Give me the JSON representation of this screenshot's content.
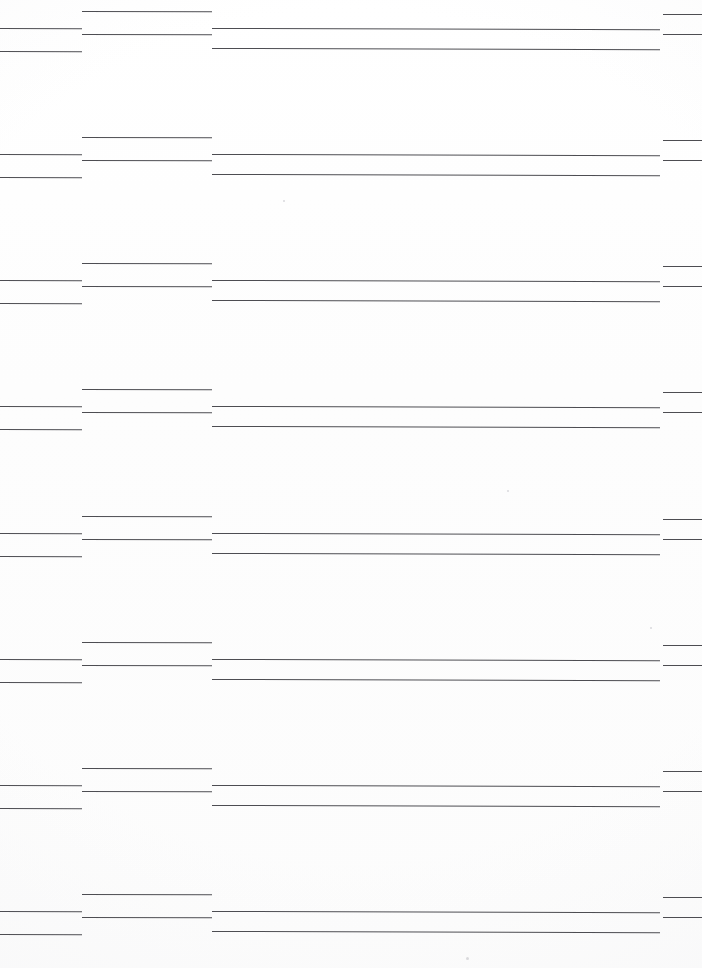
{
  "document": {
    "kind": "scanned-ruled-sheet",
    "page_width": 702,
    "page_height": 968,
    "background_color": "#ffffff",
    "rule_color": "#4d4d52",
    "visible_text": "",
    "note": ""
  },
  "columns": [
    {
      "id": "col-left",
      "x": 0,
      "width": 82
    },
    {
      "id": "col-second",
      "x": 82,
      "width": 130
    },
    {
      "id": "col-main",
      "x": 212,
      "width": 448
    },
    {
      "id": "col-right",
      "x": 663,
      "width": 39
    }
  ],
  "groups": [
    {
      "id": "group-1",
      "top": 0,
      "rules": [
        {
          "col": "col-second",
          "y": 11,
          "x": 82,
          "width": 130,
          "weight": "light",
          "skew": "skew-mid"
        },
        {
          "col": "col-right",
          "y": 14,
          "x": 663,
          "width": 39,
          "weight": "light",
          "skew": "skew-short"
        },
        {
          "col": "col-left",
          "y": 28,
          "x": 0,
          "width": 82,
          "weight": "light",
          "skew": "skew-short"
        },
        {
          "col": "col-main",
          "y": 28,
          "x": 212,
          "width": 448,
          "weight": "light",
          "skew": "skew-long"
        },
        {
          "col": "col-second",
          "y": 34,
          "x": 82,
          "width": 130,
          "weight": "dark",
          "skew": "skew-mid"
        },
        {
          "col": "col-right",
          "y": 34,
          "x": 663,
          "width": 39,
          "weight": "dark",
          "skew": "skew-short"
        },
        {
          "col": "col-left",
          "y": 51,
          "x": 0,
          "width": 82,
          "weight": "dark",
          "skew": "skew-short"
        },
        {
          "col": "col-main",
          "y": 48,
          "x": 212,
          "width": 448,
          "weight": "dark",
          "skew": "skew-long"
        }
      ]
    },
    {
      "id": "group-2",
      "top": 126,
      "rules": [
        {
          "col": "col-second",
          "y": 11,
          "x": 82,
          "width": 130,
          "weight": "light",
          "skew": "skew-mid"
        },
        {
          "col": "col-right",
          "y": 14,
          "x": 663,
          "width": 39,
          "weight": "light",
          "skew": "skew-short"
        },
        {
          "col": "col-left",
          "y": 28,
          "x": 0,
          "width": 82,
          "weight": "light",
          "skew": "skew-short"
        },
        {
          "col": "col-main",
          "y": 28,
          "x": 212,
          "width": 448,
          "weight": "light",
          "skew": "skew-long"
        },
        {
          "col": "col-second",
          "y": 34,
          "x": 82,
          "width": 130,
          "weight": "dark",
          "skew": "skew-mid"
        },
        {
          "col": "col-right",
          "y": 34,
          "x": 663,
          "width": 39,
          "weight": "dark",
          "skew": "skew-short"
        },
        {
          "col": "col-left",
          "y": 51,
          "x": 0,
          "width": 82,
          "weight": "dark",
          "skew": "skew-short"
        },
        {
          "col": "col-main",
          "y": 48,
          "x": 212,
          "width": 448,
          "weight": "dark",
          "skew": "skew-long"
        }
      ]
    },
    {
      "id": "group-3",
      "top": 252,
      "rules": [
        {
          "col": "col-second",
          "y": 11,
          "x": 82,
          "width": 130,
          "weight": "light",
          "skew": "skew-mid"
        },
        {
          "col": "col-right",
          "y": 14,
          "x": 663,
          "width": 39,
          "weight": "light",
          "skew": "skew-short"
        },
        {
          "col": "col-left",
          "y": 28,
          "x": 0,
          "width": 82,
          "weight": "light",
          "skew": "skew-short"
        },
        {
          "col": "col-main",
          "y": 28,
          "x": 212,
          "width": 448,
          "weight": "light",
          "skew": "skew-long"
        },
        {
          "col": "col-second",
          "y": 34,
          "x": 82,
          "width": 130,
          "weight": "dark",
          "skew": "skew-mid"
        },
        {
          "col": "col-right",
          "y": 34,
          "x": 663,
          "width": 39,
          "weight": "dark",
          "skew": "skew-short"
        },
        {
          "col": "col-left",
          "y": 51,
          "x": 0,
          "width": 82,
          "weight": "dark",
          "skew": "skew-short"
        },
        {
          "col": "col-main",
          "y": 48,
          "x": 212,
          "width": 448,
          "weight": "dark",
          "skew": "skew-long"
        }
      ]
    },
    {
      "id": "group-4",
      "top": 378,
      "rules": [
        {
          "col": "col-second",
          "y": 11,
          "x": 82,
          "width": 130,
          "weight": "light",
          "skew": "skew-mid"
        },
        {
          "col": "col-right",
          "y": 14,
          "x": 663,
          "width": 39,
          "weight": "light",
          "skew": "skew-short"
        },
        {
          "col": "col-left",
          "y": 28,
          "x": 0,
          "width": 82,
          "weight": "light",
          "skew": "skew-short"
        },
        {
          "col": "col-main",
          "y": 28,
          "x": 212,
          "width": 448,
          "weight": "light",
          "skew": "skew-long"
        },
        {
          "col": "col-second",
          "y": 34,
          "x": 82,
          "width": 130,
          "weight": "dark",
          "skew": "skew-mid"
        },
        {
          "col": "col-right",
          "y": 34,
          "x": 663,
          "width": 39,
          "weight": "dark",
          "skew": "skew-short"
        },
        {
          "col": "col-left",
          "y": 51,
          "x": 0,
          "width": 82,
          "weight": "dark",
          "skew": "skew-short"
        },
        {
          "col": "col-main",
          "y": 48,
          "x": 212,
          "width": 448,
          "weight": "dark",
          "skew": "skew-long"
        }
      ]
    },
    {
      "id": "group-5",
      "top": 505,
      "rules": [
        {
          "col": "col-second",
          "y": 11,
          "x": 82,
          "width": 130,
          "weight": "light",
          "skew": "skew-mid"
        },
        {
          "col": "col-right",
          "y": 14,
          "x": 663,
          "width": 39,
          "weight": "light",
          "skew": "skew-short"
        },
        {
          "col": "col-left",
          "y": 28,
          "x": 0,
          "width": 82,
          "weight": "light",
          "skew": "skew-short"
        },
        {
          "col": "col-main",
          "y": 28,
          "x": 212,
          "width": 448,
          "weight": "light",
          "skew": "skew-long"
        },
        {
          "col": "col-second",
          "y": 34,
          "x": 82,
          "width": 130,
          "weight": "dark",
          "skew": "skew-mid"
        },
        {
          "col": "col-right",
          "y": 34,
          "x": 663,
          "width": 39,
          "weight": "dark",
          "skew": "skew-short"
        },
        {
          "col": "col-left",
          "y": 51,
          "x": 0,
          "width": 82,
          "weight": "dark",
          "skew": "skew-short"
        },
        {
          "col": "col-main",
          "y": 48,
          "x": 212,
          "width": 448,
          "weight": "dark",
          "skew": "skew-long"
        }
      ]
    },
    {
      "id": "group-6",
      "top": 631,
      "rules": [
        {
          "col": "col-second",
          "y": 11,
          "x": 82,
          "width": 130,
          "weight": "light",
          "skew": "skew-mid"
        },
        {
          "col": "col-right",
          "y": 14,
          "x": 663,
          "width": 39,
          "weight": "light",
          "skew": "skew-short"
        },
        {
          "col": "col-left",
          "y": 28,
          "x": 0,
          "width": 82,
          "weight": "light",
          "skew": "skew-short"
        },
        {
          "col": "col-main",
          "y": 28,
          "x": 212,
          "width": 448,
          "weight": "light",
          "skew": "skew-long"
        },
        {
          "col": "col-second",
          "y": 34,
          "x": 82,
          "width": 130,
          "weight": "dark",
          "skew": "skew-mid"
        },
        {
          "col": "col-right",
          "y": 34,
          "x": 663,
          "width": 39,
          "weight": "dark",
          "skew": "skew-short"
        },
        {
          "col": "col-left",
          "y": 51,
          "x": 0,
          "width": 82,
          "weight": "dark",
          "skew": "skew-short"
        },
        {
          "col": "col-main",
          "y": 48,
          "x": 212,
          "width": 448,
          "weight": "dark",
          "skew": "skew-long"
        }
      ]
    },
    {
      "id": "group-7",
      "top": 757,
      "rules": [
        {
          "col": "col-second",
          "y": 11,
          "x": 82,
          "width": 130,
          "weight": "light",
          "skew": "skew-mid"
        },
        {
          "col": "col-right",
          "y": 14,
          "x": 663,
          "width": 39,
          "weight": "light",
          "skew": "skew-short"
        },
        {
          "col": "col-left",
          "y": 28,
          "x": 0,
          "width": 82,
          "weight": "light",
          "skew": "skew-short"
        },
        {
          "col": "col-main",
          "y": 28,
          "x": 212,
          "width": 448,
          "weight": "light",
          "skew": "skew-long"
        },
        {
          "col": "col-second",
          "y": 34,
          "x": 82,
          "width": 130,
          "weight": "dark",
          "skew": "skew-mid"
        },
        {
          "col": "col-right",
          "y": 34,
          "x": 663,
          "width": 39,
          "weight": "dark",
          "skew": "skew-short"
        },
        {
          "col": "col-left",
          "y": 51,
          "x": 0,
          "width": 82,
          "weight": "dark",
          "skew": "skew-short"
        },
        {
          "col": "col-main",
          "y": 48,
          "x": 212,
          "width": 448,
          "weight": "dark",
          "skew": "skew-long"
        }
      ]
    },
    {
      "id": "group-8",
      "top": 883,
      "rules": [
        {
          "col": "col-second",
          "y": 11,
          "x": 82,
          "width": 130,
          "weight": "light",
          "skew": "skew-mid"
        },
        {
          "col": "col-right",
          "y": 14,
          "x": 663,
          "width": 39,
          "weight": "light",
          "skew": "skew-short"
        },
        {
          "col": "col-left",
          "y": 28,
          "x": 0,
          "width": 82,
          "weight": "light",
          "skew": "skew-short"
        },
        {
          "col": "col-main",
          "y": 28,
          "x": 212,
          "width": 448,
          "weight": "light",
          "skew": "skew-long"
        },
        {
          "col": "col-second",
          "y": 34,
          "x": 82,
          "width": 130,
          "weight": "dark",
          "skew": "skew-mid"
        },
        {
          "col": "col-right",
          "y": 34,
          "x": 663,
          "width": 39,
          "weight": "dark",
          "skew": "skew-short"
        },
        {
          "col": "col-left",
          "y": 51,
          "x": 0,
          "width": 82,
          "weight": "dark",
          "skew": "skew-short"
        },
        {
          "col": "col-main",
          "y": 48,
          "x": 212,
          "width": 448,
          "weight": "dark",
          "skew": "skew-long"
        }
      ]
    }
  ],
  "artifacts": [
    {
      "x": 507,
      "y": 490,
      "size": 2
    },
    {
      "x": 650,
      "y": 627,
      "size": 2
    },
    {
      "x": 466,
      "y": 957,
      "size": 3
    },
    {
      "x": 283,
      "y": 200,
      "size": 2
    }
  ]
}
